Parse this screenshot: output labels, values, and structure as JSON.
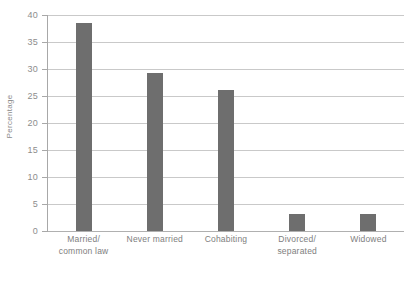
{
  "chart_data": {
    "type": "bar",
    "title": "",
    "subtitle": "",
    "xlabel": "",
    "ylabel": "Percentage",
    "ylim": [
      0,
      40
    ],
    "ytick_step": 5,
    "yticks": [
      0,
      5,
      10,
      15,
      20,
      25,
      30,
      35,
      40
    ],
    "ytick_labels": [
      "0",
      "5",
      "10",
      "15",
      "20",
      "25",
      "30",
      "35",
      "40"
    ],
    "grid": "horizontal",
    "legend": "none",
    "categories": [
      "Married/ common law",
      "Never married",
      "Cohabiting",
      "Divorced/ separated",
      "Widowed"
    ],
    "category_lines": [
      [
        "Married/",
        "common law"
      ],
      [
        "Never married",
        ""
      ],
      [
        "Cohabiting",
        ""
      ],
      [
        "Divorced/",
        "separated"
      ],
      [
        "Widowed",
        ""
      ]
    ],
    "values": [
      38.5,
      29.2,
      26.2,
      3.1,
      3.1
    ],
    "colors": {
      "bar": "#6e6e6e",
      "gridline": "#c9c9c9",
      "axis": "#a8a8a8",
      "tick_text": "#8d8d8d",
      "label_text": "#7e7e7e",
      "background": "#ffffff"
    }
  }
}
